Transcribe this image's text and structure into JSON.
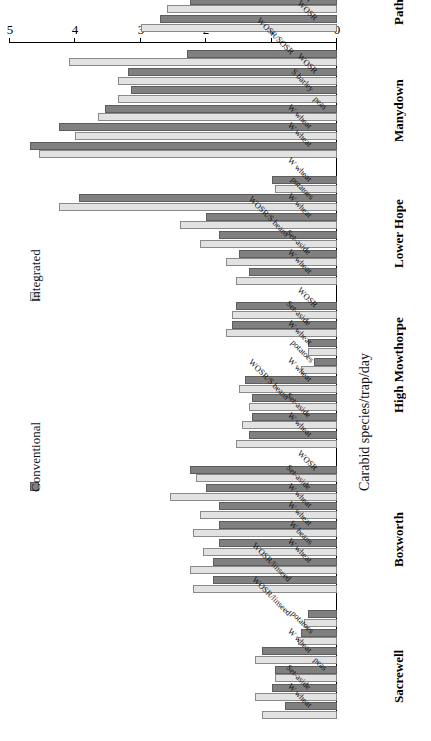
{
  "chart_data": {
    "type": "bar",
    "orientation": "horizontal-rotated-180",
    "title": "",
    "xlabel": "",
    "ylabel": "Carabid species/trap/day",
    "ylim": [
      0,
      5
    ],
    "yticks": [
      "0",
      "1",
      "2",
      "3",
      "4",
      "5"
    ],
    "grid": false,
    "legend_position": "middle-left",
    "legend": [
      {
        "name": "Conventional",
        "color": "#808080"
      },
      {
        "name": "Integrated",
        "color": "#e2e2e2"
      }
    ],
    "series": [
      {
        "name": "Conventional",
        "color": "#808080"
      },
      {
        "name": "Integrated",
        "color": "#e2e2e2"
      }
    ],
    "groups": [
      {
        "site": "Sacrewell",
        "categories": [
          "W wheat",
          "Set-aside",
          "peas",
          "W wheat",
          "potatoes",
          "WOSR/linseed"
        ],
        "conventional": [
          0.8,
          1.0,
          0.95,
          1.15,
          0.55,
          0.45
        ],
        "integrated": [
          1.15,
          1.25,
          0.95,
          1.25,
          0.6,
          0.5
        ]
      },
      {
        "site": "Boxworth",
        "categories": [
          "WOSR/linseed",
          "W wheat",
          "W beans",
          "W wheat",
          "W wheat",
          "Set-aside",
          "WOSR"
        ],
        "conventional": [
          1.9,
          1.9,
          1.8,
          1.8,
          1.8,
          2.0,
          2.25
        ],
        "integrated": [
          2.2,
          2.25,
          2.05,
          2.2,
          2.1,
          2.55,
          2.15
        ]
      },
      {
        "site": "High Mowthorpe",
        "categories": [
          "W wheat",
          "Set-aside",
          "WOSR/S beans",
          "W wheat",
          "potatoes",
          "W wheat",
          "Set-aside",
          "WOSR"
        ],
        "conventional": [
          1.35,
          1.3,
          1.3,
          1.4,
          0.35,
          0.45,
          1.6,
          1.55
        ],
        "integrated": [
          1.55,
          1.45,
          1.35,
          1.5,
          0.55,
          0.45,
          1.7,
          1.6
        ]
      },
      {
        "site": "Lower Hope",
        "categories": [
          "W wheat",
          "Set-aside",
          "WOSR/S beans",
          "W wheat",
          "potatoes",
          "W wheat"
        ],
        "conventional": [
          1.35,
          1.5,
          1.8,
          2.0,
          3.95,
          1.0
        ],
        "integrated": [
          1.55,
          1.7,
          2.1,
          2.4,
          4.25,
          0.95
        ]
      },
      {
        "site": "Manydown",
        "categories": [
          "W wheat",
          "W wheat",
          "peas",
          "S barley",
          "WOSR",
          "WOSR/SOSR"
        ],
        "conventional": [
          4.7,
          4.25,
          3.55,
          3.15,
          3.2,
          2.3
        ],
        "integrated": [
          4.55,
          4.0,
          3.65,
          3.35,
          3.35,
          4.1
        ]
      },
      {
        "site": "Pathhead",
        "categories": [
          "WOSR",
          "W wheat",
          "Set-aside",
          "W wheat",
          "W/S barley"
        ],
        "conventional": [
          2.7,
          2.25,
          2.7,
          1.75,
          2.9
        ],
        "integrated": [
          3.0,
          2.6,
          2.85,
          2.45,
          2.8
        ]
      }
    ]
  }
}
